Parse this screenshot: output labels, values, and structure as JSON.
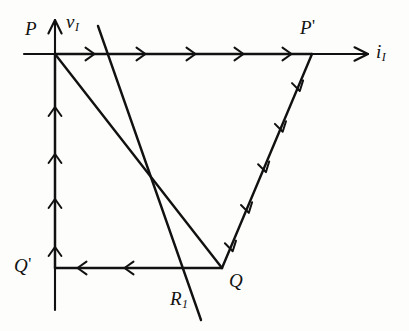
{
  "figure": {
    "background_color": "#fdfdfb",
    "ink_color": "#111111",
    "axes": {
      "horizontal": {
        "name": "i_I",
        "label_base": "i",
        "label_sub": "I",
        "x_start": 24,
        "x_end": 368,
        "y": 54
      },
      "vertical": {
        "name": "v_I",
        "label_base": "v",
        "label_sub": "I",
        "x": 55,
        "y_start": 310,
        "y_end": 18
      }
    },
    "points": [
      {
        "id": "P",
        "label_base": "P",
        "label_prime": "",
        "x": 55,
        "y": 54,
        "label_x": 25,
        "label_y": 19
      },
      {
        "id": "P2",
        "label_base": "P",
        "label_prime": "'",
        "x": 312,
        "y": 54,
        "label_x": 300,
        "label_y": 17
      },
      {
        "id": "Q",
        "label_base": "Q",
        "label_prime": "",
        "x": 222,
        "y": 268,
        "label_x": 229,
        "label_y": 271
      },
      {
        "id": "Q2",
        "label_base": "Q",
        "label_prime": "'",
        "x": 55,
        "y": 268,
        "label_x": 14,
        "label_y": 255
      }
    ],
    "axis_labels": [
      {
        "id": "v_I_label",
        "base": "v",
        "sub": "I",
        "x": 66,
        "y": 12
      },
      {
        "id": "i_I_label",
        "base": "i",
        "sub": "I",
        "x": 376,
        "y": 42
      }
    ],
    "line_labels": [
      {
        "id": "R1_label",
        "base": "R",
        "sub": "1",
        "x": 170,
        "y": 289
      }
    ],
    "path_segments": [
      {
        "id": "P-to-Pprime",
        "from": "P",
        "to": "P2",
        "x1": 55,
        "y1": 54,
        "x2": 312,
        "y2": 54,
        "arrow_count": 5,
        "direction": "right"
      },
      {
        "id": "Pprime-to-Q",
        "from": "P2",
        "to": "Q",
        "x1": 312,
        "y1": 54,
        "x2": 222,
        "y2": 268,
        "arrow_count": 5,
        "direction": "down-left"
      },
      {
        "id": "Q-to-Qprime",
        "from": "Q",
        "to": "Q2",
        "x1": 222,
        "y1": 268,
        "x2": 55,
        "y2": 268,
        "arrow_count": 2,
        "direction": "left"
      },
      {
        "id": "Qprime-to-P",
        "from": "Q2",
        "to": "P",
        "x1": 55,
        "y1": 268,
        "x2": 55,
        "y2": 54,
        "arrow_count": 4,
        "direction": "up"
      }
    ],
    "load_line": {
      "id": "load-line-P-Q",
      "x1": 55,
      "y1": 54,
      "x2": 222,
      "y2": 268
    },
    "resistance_line": {
      "id": "resistance-line-R1",
      "x1": 98,
      "y1": 26,
      "x2": 201,
      "y2": 320
    }
  }
}
